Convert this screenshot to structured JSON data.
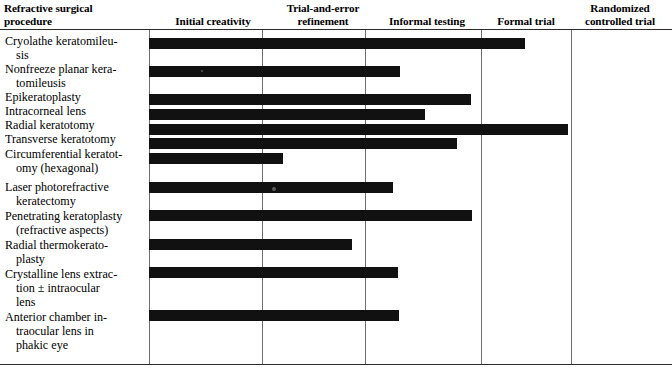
{
  "table": {
    "caption_columns": {
      "procedure": {
        "line1": "Refractive surgical",
        "line2": "procedure"
      },
      "initial_creativity": {
        "line1": "Initial creativity",
        "line2": ""
      },
      "trial_error": {
        "line1": "Trial-and-error",
        "line2": "refinement"
      },
      "informal_testing": {
        "line1": "Informal testing",
        "line2": ""
      },
      "formal_trial": {
        "line1": "Formal trial",
        "line2": ""
      },
      "randomized": {
        "line1": "Randomized",
        "line2": "controlled trial"
      }
    },
    "column_order": [
      "procedure",
      "initial_creativity",
      "trial_error",
      "informal_testing",
      "formal_trial",
      "randomized"
    ]
  },
  "chart_data": {
    "type": "bar",
    "title": "",
    "xlabel": "",
    "ylabel": "",
    "orientation": "horizontal",
    "stage_axis": [
      "Initial creativity",
      "Trial-and-error refinement",
      "Informal testing",
      "Formal trial",
      "Randomized controlled trial"
    ],
    "stage_boundaries_px": [
      149,
      262,
      365,
      481,
      571
    ],
    "bar_start_px": 149,
    "categories": [
      "Cryolathe keratomileusis",
      "Nonfreeze planar keratomileusis",
      "Epikeratoplasty",
      "Intracorneal lens",
      "Radial keratotomy",
      "Transverse keratotomy",
      "Circumferential keratotomy (hexagonal)",
      "Laser photorefractive keratectomy",
      "Penetrating keratoplasty (refractive aspects)",
      "Radial thermokeratoplasty",
      "Crystalline lens extraction ± intraocular lens",
      "Anterior chamber intraocular lens in phakic eye"
    ],
    "values": [
      3.6,
      2.2,
      3.0,
      2.6,
      4.2,
      2.9,
      1.2,
      2.1,
      3.0,
      1.8,
      2.2,
      2.2
    ],
    "value_unit": "development stages reached",
    "xlim": [
      0,
      5
    ],
    "grid": true,
    "legend": null
  },
  "rows": [
    {
      "label_lines": [
        "Cryolathe keratomileu-",
        "sis"
      ],
      "bar_end_px": 525,
      "bar_top_px": 38,
      "label_top_px": 34
    },
    {
      "label_lines": [
        "Nonfreeze planar kera-",
        "tomileusis"
      ],
      "bar_end_px": 400,
      "bar_top_px": 66,
      "label_top_px": 62
    },
    {
      "label_lines": [
        "Epikeratoplasty"
      ],
      "bar_end_px": 471,
      "bar_top_px": 94,
      "label_top_px": 90
    },
    {
      "label_lines": [
        "Intracorneal lens"
      ],
      "bar_end_px": 425,
      "bar_top_px": 109,
      "label_top_px": 104
    },
    {
      "label_lines": [
        "Radial keratotomy"
      ],
      "bar_end_px": 568,
      "bar_top_px": 124,
      "label_top_px": 118
    },
    {
      "label_lines": [
        "Transverse keratotomy"
      ],
      "bar_end_px": 457,
      "bar_top_px": 138,
      "label_top_px": 132
    },
    {
      "label_lines": [
        "Circumferential keratot-",
        "omy (hexagonal)"
      ],
      "bar_end_px": 283,
      "bar_top_px": 153,
      "label_top_px": 147
    },
    {
      "label_lines": [
        "Laser photorefractive",
        "keratectomy"
      ],
      "bar_end_px": 393,
      "bar_top_px": 182,
      "label_top_px": 180
    },
    {
      "label_lines": [
        "Penetrating keratoplasty",
        "(refractive aspects)"
      ],
      "bar_end_px": 472,
      "bar_top_px": 210,
      "label_top_px": 209
    },
    {
      "label_lines": [
        "Radial thermokerato-",
        "plasty"
      ],
      "bar_end_px": 352,
      "bar_top_px": 239,
      "label_top_px": 238
    },
    {
      "label_lines": [
        "Crystalline lens extrac-",
        "tion ± intraocular",
        "lens"
      ],
      "bar_end_px": 398,
      "bar_top_px": 267,
      "label_top_px": 267
    },
    {
      "label_lines": [
        "Anterior chamber in-",
        "traocular lens in",
        "phakic eye"
      ],
      "bar_end_px": 399,
      "bar_top_px": 310,
      "label_top_px": 310
    }
  ],
  "colors": {
    "bar": "#111111",
    "rule": "#2b2b2b",
    "divider": "#6f6f6f",
    "background": "#ffffff",
    "text": "#000000"
  }
}
